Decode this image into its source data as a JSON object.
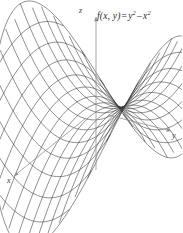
{
  "figure": {
    "name": "saddle-surface-plot",
    "background_color": "#ffffff",
    "mesh_color": "#333333",
    "axis_color": "#8a8a8a",
    "text_color": "#2a2a2a"
  },
  "equation": {
    "function_name": "f",
    "arguments": "(x, y)",
    "equals": "=",
    "term1_base": "y",
    "term1_exponent": "2",
    "operator": "–",
    "term2_base": "x",
    "term2_exponent": "2",
    "full_text": "f(x, y) = y² – x²"
  },
  "axes": [
    {
      "id": "z",
      "label": "z",
      "direction": "up"
    },
    {
      "id": "y",
      "label": "y",
      "direction": "right-down"
    },
    {
      "id": "x",
      "label": "x",
      "direction": "left-down"
    }
  ],
  "chart_data": {
    "type": "surface",
    "title": "",
    "subtitle": "",
    "equation": "f(x, y) = y² – x²",
    "surface_name": "hyperbolic paraboloid (saddle)",
    "xlabel": "x",
    "ylabel": "y",
    "zlabel": "z",
    "xlim": [
      -1,
      1
    ],
    "ylim": [
      -1,
      1
    ],
    "zlim": [
      -1,
      1
    ],
    "grid": true,
    "legend": false,
    "wireframe": true,
    "mesh_u_lines": 17,
    "mesh_v_lines": 17,
    "projection": {
      "type": "axonometric",
      "origin_px": [
        96,
        112
      ],
      "x_axis_px": [
        -1.62,
        1.03
      ],
      "y_axis_px": [
        1.72,
        0.4
      ],
      "z_axis_px": [
        0.0,
        -1.62
      ],
      "x_scale": 44,
      "y_scale": 44,
      "z_scale": 56
    },
    "annotations": [
      {
        "text": "z",
        "kind": "axis-label"
      },
      {
        "text": "y",
        "kind": "axis-label"
      },
      {
        "text": "x",
        "kind": "axis-label"
      },
      {
        "text": "f(x, y) = y² – x²",
        "kind": "equation-label"
      }
    ]
  }
}
